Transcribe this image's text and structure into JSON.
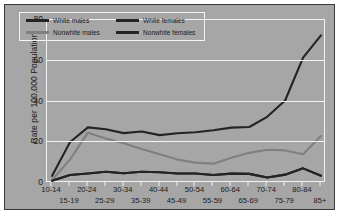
{
  "chart_data": {
    "type": "line",
    "title": "",
    "xlabel": "",
    "ylabel": "Rate per 100,000 Population",
    "ylim": [
      0,
      80
    ],
    "yticks": [
      0,
      20,
      40,
      60,
      80
    ],
    "grid": true,
    "legend_position": "top-left",
    "categories": [
      "10-14",
      "15-19",
      "20-24",
      "25-29",
      "30-34",
      "35-39",
      "40-44",
      "45-49",
      "50-54",
      "55-59",
      "60-64",
      "65-69",
      "70-74",
      "75-79",
      "80-84",
      "85+"
    ],
    "series": [
      {
        "name": "White males",
        "color": "#242424",
        "values": [
          3.0,
          19.5,
          26.8,
          25.9,
          24.0,
          24.8,
          23.0,
          23.9,
          24.4,
          25.4,
          26.7,
          27.0,
          32.0,
          40.0,
          61.0,
          72.0
        ]
      },
      {
        "name": "White females",
        "color": "#242424",
        "values": [
          0.6,
          3.4,
          4.2,
          5.0,
          4.3,
          5.0,
          4.8,
          4.2,
          4.2,
          3.4,
          4.1,
          4.0,
          2.2,
          3.6,
          6.7,
          3.1
        ]
      },
      {
        "name": "Nonwhite males",
        "color": "#808080",
        "values": [
          1.0,
          11.0,
          24.2,
          21.4,
          19.0,
          16.2,
          13.6,
          11.0,
          9.5,
          9.0,
          11.9,
          14.3,
          15.8,
          15.5,
          13.6,
          22.6
        ]
      },
      {
        "name": "Nonwhite females",
        "color": "#242424",
        "values": [
          0.6,
          3.4,
          4.2,
          5.0,
          4.3,
          5.0,
          4.8,
          4.2,
          4.2,
          3.4,
          4.1,
          4.0,
          2.2,
          3.6,
          6.7,
          3.1
        ]
      }
    ]
  },
  "legend": {
    "items": [
      {
        "label": "White males",
        "swatch": "dark"
      },
      {
        "label": "White females",
        "swatch": "dark"
      },
      {
        "label": "Nonwhite males",
        "swatch": "gray"
      },
      {
        "label": "Nonwhite females",
        "swatch": "dark"
      }
    ]
  },
  "axis": {
    "y_title": "Rate per 100,000 Population",
    "y_ticks": [
      "0",
      "20",
      "40",
      "60",
      "80"
    ],
    "x_ticks": [
      "10-14",
      "15-19",
      "20-24",
      "25-29",
      "30-34",
      "35-39",
      "40-44",
      "45-49",
      "50-54",
      "55-59",
      "60-64",
      "65-69",
      "70-74",
      "75-79",
      "80-84",
      "85+"
    ]
  },
  "colors": {
    "plot_background": "#a6a6a6",
    "grid": "#f4f4f4",
    "series_dark": "#242424",
    "series_gray": "#808080",
    "text": "#1c1c1c"
  }
}
